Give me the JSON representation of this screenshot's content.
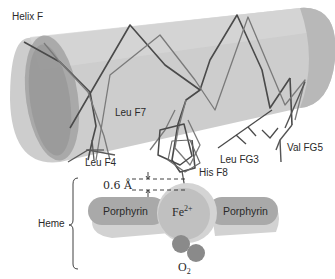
{
  "figure": {
    "helix_label": "Helix F",
    "residues": [
      {
        "id": "leu_f7",
        "label": "Leu F7"
      },
      {
        "id": "leu_f4",
        "label": "Leu F4"
      },
      {
        "id": "his_f8",
        "label": "His F8"
      },
      {
        "id": "leu_fg3",
        "label": "Leu FG3"
      },
      {
        "id": "val_fg5",
        "label": "Val FG5"
      }
    ],
    "distance_label": "0.6 Å",
    "heme_label": "Heme",
    "porphyrin_left_label": "Porphyrin",
    "porphyrin_right_label": "Porphyrin",
    "iron": {
      "symbol": "Fe",
      "charge": "2+"
    },
    "oxygen": {
      "symbol": "O",
      "subscript": "2"
    }
  },
  "colors": {
    "cylinder_body": "#c6c6c6",
    "cylinder_dark": "#a8a8a8",
    "cylinder_end": "#999999",
    "chain_dark": "#4a4a4a",
    "chain_light": "#7a7a7a",
    "porphyrin_top": "#a9a9a9",
    "porphyrin_shadow": "#cfcfcf",
    "iron_sphere": "#c2c2c2",
    "oxygen_atom": "#8a8a8a",
    "text": "#2a2a2a"
  }
}
